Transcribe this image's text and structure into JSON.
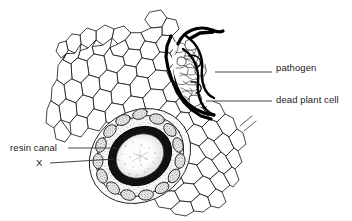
{
  "figure": {
    "type": "biological-diagram",
    "background_color": "#ffffff",
    "ink_color": "#000000"
  },
  "labels": {
    "pathogen": "pathogen",
    "dead_plant_cell": "dead plant cell",
    "resin_canal": "resin canal",
    "x": "X"
  },
  "leader_lines": [
    {
      "name": "pathogen-leader",
      "from_x": 215,
      "from_y": 72,
      "to_x": 272,
      "to_y": 72
    },
    {
      "name": "dead-plant-cell-leader",
      "from_x": 206,
      "from_y": 101,
      "to_x": 272,
      "to_y": 101
    },
    {
      "name": "resin-canal-leader",
      "from_x": 68,
      "from_y": 148,
      "to_x": 116,
      "to_y": 148
    },
    {
      "name": "x-leader",
      "from_x": 50,
      "from_y": 163,
      "to_x": 112,
      "to_y": 160
    }
  ],
  "structures": {
    "healthy_tissue": "parenchyma cells",
    "resin_canal": "oval duct with epithelial cell ring and stippled sheath",
    "infection_zone": "thick dark boundary with degraded cell mass"
  }
}
